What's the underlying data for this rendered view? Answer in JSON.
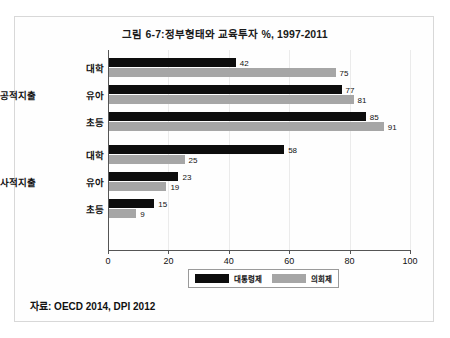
{
  "chart_data": {
    "type": "bar",
    "orientation": "horizontal",
    "title": "그림 6-7:정부형태와 교육투자 %, 1997-2011",
    "xlabel": "",
    "ylabel": "",
    "xlim": [
      0,
      100
    ],
    "xticks": [
      0,
      20,
      40,
      60,
      80,
      100
    ],
    "grid": true,
    "legend_position": "bottom",
    "groups": [
      {
        "name": "공적지출",
        "categories": [
          "대학",
          "유아",
          "초등"
        ],
        "series": [
          {
            "name": "대통령제",
            "values": [
              42,
              77,
              85
            ]
          },
          {
            "name": "의회제",
            "values": [
              75,
              81,
              91
            ]
          }
        ]
      },
      {
        "name": "사적지출",
        "categories": [
          "대학",
          "유아",
          "초등"
        ],
        "series": [
          {
            "name": "대통령제",
            "values": [
              58,
              23,
              15
            ]
          },
          {
            "name": "의회제",
            "values": [
              25,
              19,
              9
            ]
          }
        ]
      }
    ],
    "series_colors": [
      "#0d0d0d",
      "#a6a6a6"
    ],
    "legend": [
      "대통령제",
      "의회제"
    ],
    "source": "자료: OECD 2014, DPI 2012"
  },
  "figure": {
    "title": "그림 6-7:정부형태와 교육투자 %, 1997-2011",
    "source": "자료: OECD 2014, DPI 2012"
  }
}
